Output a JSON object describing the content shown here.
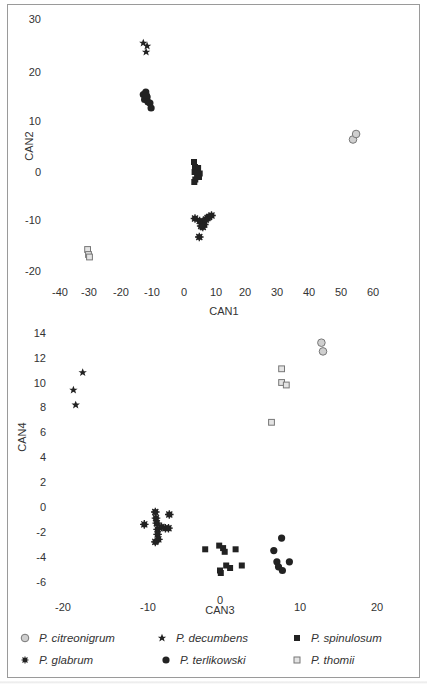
{
  "chart_data": [
    {
      "type": "scatter",
      "title": "",
      "xlabel": "CAN1",
      "ylabel": "CAN2",
      "xlim": [
        -40,
        65
      ],
      "ylim": [
        -22,
        31
      ],
      "xticks": [
        -40,
        -30,
        -20,
        -10,
        0,
        10,
        20,
        30,
        40,
        50,
        60
      ],
      "yticks": [
        -20,
        -10,
        0,
        10,
        20,
        30
      ],
      "grid": false,
      "series": [
        {
          "name": "P. citreonigrum",
          "marker": "circle-open-gray",
          "points": [
            [
              54.0,
              6.5
            ],
            [
              55.0,
              7.6
            ]
          ]
        },
        {
          "name": "P. decumbens",
          "marker": "star",
          "points": [
            [
              -13.0,
              25.8
            ],
            [
              -11.8,
              25.2
            ],
            [
              -12.1,
              24.0
            ]
          ]
        },
        {
          "name": "P. spinulosum",
          "marker": "square-filled",
          "points": [
            [
              3.2,
              2.0
            ],
            [
              3.5,
              1.0
            ],
            [
              4.5,
              0.8
            ],
            [
              3.4,
              0.0
            ],
            [
              5.0,
              -0.3
            ],
            [
              4.2,
              -0.8
            ],
            [
              3.6,
              -1.5
            ],
            [
              4.8,
              -1.0
            ],
            [
              3.3,
              -2.0
            ]
          ]
        },
        {
          "name": "P. glabrum",
          "marker": "asterisk",
          "points": [
            [
              3.5,
              -9.3
            ],
            [
              5.0,
              -9.8
            ],
            [
              6.0,
              -10.0
            ],
            [
              6.5,
              -10.5
            ],
            [
              7.0,
              -9.5
            ],
            [
              7.5,
              -9.2
            ],
            [
              8.0,
              -9.0
            ],
            [
              8.8,
              -8.7
            ],
            [
              6.0,
              -11.0
            ],
            [
              5.5,
              -10.8
            ],
            [
              4.9,
              -13.0
            ]
          ]
        },
        {
          "name": "P. terlikowski",
          "marker": "circle-filled",
          "points": [
            [
              -13.0,
              15.5
            ],
            [
              -12.2,
              16.0
            ],
            [
              -11.8,
              15.0
            ],
            [
              -12.6,
              14.5
            ],
            [
              -11.5,
              14.0
            ],
            [
              -10.9,
              13.8
            ],
            [
              -10.5,
              12.8
            ],
            [
              -12.0,
              15.3
            ]
          ]
        },
        {
          "name": "P. thomii",
          "marker": "square-open-gray",
          "points": [
            [
              -30.8,
              -15.5
            ],
            [
              -30.5,
              -16.5
            ],
            [
              -30.2,
              -17.0
            ]
          ]
        }
      ]
    },
    {
      "type": "scatter",
      "title": "",
      "xlabel": "CAN3",
      "ylabel": "CAN4",
      "xlim": [
        -21,
        23
      ],
      "ylim": [
        -7,
        15
      ],
      "xticks": [
        -20,
        -10,
        0,
        10,
        20
      ],
      "yticks": [
        -6,
        -4,
        -2,
        0,
        2,
        4,
        6,
        8,
        10,
        12,
        14
      ],
      "grid": false,
      "series": [
        {
          "name": "P. citreonigrum",
          "marker": "circle-open-gray",
          "points": [
            [
              13.0,
              13.2
            ],
            [
              13.2,
              12.5
            ]
          ]
        },
        {
          "name": "P. decumbens",
          "marker": "star",
          "points": [
            [
              -17.6,
              10.8
            ],
            [
              -18.8,
              9.4
            ],
            [
              -18.5,
              8.2
            ]
          ]
        },
        {
          "name": "P. spinulosum",
          "marker": "square-filled",
          "points": [
            [
              -1.9,
              -3.4
            ],
            [
              -0.1,
              -3.1
            ],
            [
              0.4,
              -3.3
            ],
            [
              0.6,
              -3.6
            ],
            [
              2.0,
              -3.4
            ],
            [
              0.8,
              -4.7
            ],
            [
              1.3,
              -4.9
            ],
            [
              2.8,
              -4.7
            ],
            [
              0.0,
              -5.1
            ],
            [
              0.1,
              -5.3
            ]
          ]
        },
        {
          "name": "P. glabrum",
          "marker": "asterisk",
          "points": [
            [
              -9.7,
              -1.4
            ],
            [
              -8.3,
              -0.4
            ],
            [
              -8.2,
              -0.9
            ],
            [
              -8.1,
              -1.3
            ],
            [
              -8.0,
              -1.8
            ],
            [
              -8.0,
              -2.2
            ],
            [
              -7.9,
              -2.6
            ],
            [
              -8.3,
              -2.8
            ],
            [
              -7.5,
              -1.6
            ],
            [
              -7.0,
              -1.7
            ],
            [
              -6.6,
              -1.7
            ],
            [
              -6.5,
              -0.6
            ]
          ]
        },
        {
          "name": "P. terlikowski",
          "marker": "circle-filled",
          "points": [
            [
              7.9,
              -2.5
            ],
            [
              6.9,
              -3.5
            ],
            [
              7.3,
              -4.4
            ],
            [
              7.5,
              -4.8
            ],
            [
              8.0,
              -5.1
            ],
            [
              8.9,
              -4.4
            ]
          ]
        },
        {
          "name": "P. thomii",
          "marker": "square-open-gray",
          "points": [
            [
              7.9,
              11.1
            ],
            [
              7.9,
              10.0
            ],
            [
              8.5,
              9.8
            ],
            [
              6.6,
              6.8
            ]
          ]
        }
      ]
    }
  ],
  "plots": {
    "top": {
      "xlabel": "CAN1",
      "ylabel": "CAN2",
      "xticks": [
        "-40",
        "-30",
        "-20",
        "-10",
        "0",
        "10",
        "20",
        "30",
        "40",
        "50",
        "60"
      ],
      "yticks": [
        "30",
        "20",
        "10",
        "0",
        "-10",
        "-20"
      ]
    },
    "bottom": {
      "xlabel": "CAN3",
      "ylabel": "CAN4",
      "xticks": [
        "-20",
        "-10",
        "0",
        "10",
        "20"
      ],
      "yticks": [
        "14",
        "12",
        "10",
        "8",
        "6",
        "4",
        "2",
        "0",
        "-2",
        "-4",
        "-6"
      ]
    }
  },
  "legend": {
    "items": [
      {
        "label": "P. citreonigrum",
        "marker": "circle-open-gray"
      },
      {
        "label": "P. decumbens",
        "marker": "star"
      },
      {
        "label": "P. spinulosum",
        "marker": "square-filled"
      },
      {
        "label": "P. glabrum",
        "marker": "asterisk"
      },
      {
        "label": "P. terlikowski",
        "marker": "circle-filled"
      },
      {
        "label": "P. thomii",
        "marker": "square-open-gray"
      }
    ]
  },
  "colors": {
    "filled": "#222222",
    "open_gray_fill": "#c8c8c8",
    "open_gray_stroke": "#777777",
    "text": "#333333",
    "frame": "#9a9a9a"
  }
}
